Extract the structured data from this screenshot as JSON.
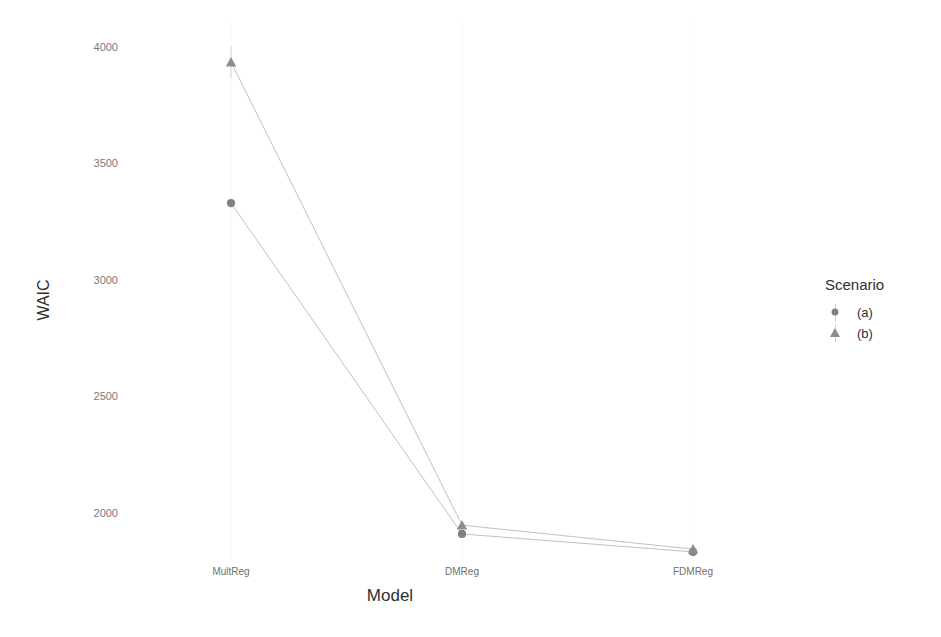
{
  "chart_data": {
    "type": "line",
    "title": "",
    "xlabel": "Model",
    "ylabel": "WAIC",
    "categories": [
      "MultReg",
      "DMReg",
      "FDMReg"
    ],
    "ylim": [
      1750,
      4080
    ],
    "yticks": [
      2000,
      2500,
      3000,
      3500,
      4000
    ],
    "ytick_labels": [
      "2000",
      "2500",
      "3000",
      "3500",
      "4000"
    ],
    "grid": "faint-vertical",
    "legend_position": "right",
    "legend_title": "Scenario",
    "series": [
      {
        "name": "(a)",
        "marker": "circle",
        "color": "#808080",
        "values": [
          3330,
          1910,
          1833
        ],
        "errors": [
          18,
          10,
          10
        ]
      },
      {
        "name": "(b)",
        "marker": "triangle",
        "color": "#8d8d8d",
        "values": [
          3935,
          1948,
          1845
        ],
        "errors": [
          70,
          12,
          12
        ]
      }
    ]
  },
  "axes": {
    "y_title": "WAIC",
    "x_title": "Model",
    "y_tick_0": "2000",
    "y_tick_1": "2500",
    "y_tick_2": "3000",
    "y_tick_3": "3500",
    "y_tick_4": "4000",
    "x_tick_0": "MultReg",
    "x_tick_1": "DMReg",
    "x_tick_2": "FDMReg"
  },
  "legend": {
    "title": "Scenario",
    "items": [
      {
        "label": "(a)",
        "marker": "circle-marker",
        "color": "#808080"
      },
      {
        "label": "(b)",
        "marker": "triangle-marker",
        "color": "#8d8d8d"
      }
    ]
  }
}
